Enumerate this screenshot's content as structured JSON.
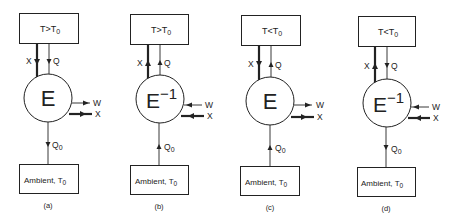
{
  "diagram": {
    "panels": [
      {
        "id": "a",
        "caption": "(a)",
        "top_box": "T>T0",
        "top_main": "T>T",
        "engine": "E",
        "engine_sup": "",
        "bottom_box": "Ambient, T",
        "sub": "0",
        "flows": {
          "X_top": {
            "label": "X",
            "direction": "down"
          },
          "Q_top": {
            "label": "Q",
            "direction": "down"
          },
          "W": {
            "label": "W",
            "direction": "out"
          },
          "X_side": {
            "label": "X",
            "direction": "out"
          },
          "Q0": {
            "label": "Q",
            "sub": "0",
            "direction": "down"
          }
        }
      },
      {
        "id": "b",
        "caption": "(b)",
        "top_main": "T>T",
        "engine": "E",
        "engine_sup": "−1",
        "bottom_box": "Ambient, T",
        "sub": "0",
        "flows": {
          "X_top": {
            "label": "X",
            "direction": "up"
          },
          "Q_top": {
            "label": "Q",
            "direction": "up"
          },
          "W": {
            "label": "W",
            "direction": "in"
          },
          "X_side": {
            "label": "X",
            "direction": "in"
          },
          "Q0": {
            "label": "Q",
            "sub": "0",
            "direction": "up"
          }
        }
      },
      {
        "id": "c",
        "caption": "(c)",
        "top_main": "T<T",
        "engine": "E",
        "engine_sup": "",
        "bottom_box": "Ambient, T",
        "sub": "0",
        "flows": {
          "X_top": {
            "label": "X",
            "direction": "down"
          },
          "Q_top": {
            "label": "Q",
            "direction": "up"
          },
          "W": {
            "label": "W",
            "direction": "out"
          },
          "X_side": {
            "label": "X",
            "direction": "out"
          },
          "Q0": {
            "label": "Q",
            "sub": "0",
            "direction": "up"
          }
        }
      },
      {
        "id": "d",
        "caption": "(d)",
        "top_main": "T<T",
        "engine": "E",
        "engine_sup": "−1",
        "bottom_box": "Ambient, T",
        "sub": "0",
        "flows": {
          "X_top": {
            "label": "X",
            "direction": "up"
          },
          "Q_top": {
            "label": "Q",
            "direction": "down"
          },
          "W": {
            "label": "W",
            "direction": "in"
          },
          "X_side": {
            "label": "X",
            "direction": "in"
          },
          "Q0": {
            "label": "Q",
            "sub": "0",
            "direction": "down"
          }
        }
      }
    ],
    "colors": {
      "line": "#222222",
      "background": "#ffffff"
    }
  }
}
